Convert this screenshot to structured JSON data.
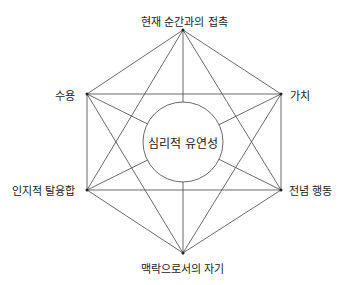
{
  "diagram": {
    "center": {
      "label": "심리적 유연성"
    },
    "nodes": [
      {
        "id": "top",
        "label": "현재 순간과의 접촉"
      },
      {
        "id": "upper-right",
        "label": "가치"
      },
      {
        "id": "lower-right",
        "label": "전념 행동"
      },
      {
        "id": "bottom",
        "label": "맥락으로서의 자기"
      },
      {
        "id": "lower-left",
        "label": "인지적 탈융합"
      },
      {
        "id": "upper-left",
        "label": "수용"
      }
    ],
    "line_color": "#444444"
  }
}
